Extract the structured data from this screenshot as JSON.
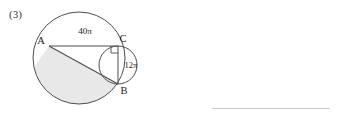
{
  "problem": {
    "number_label": "(3)"
  },
  "figure": {
    "name": "circle-geometry-figure",
    "points": [
      {
        "id": "A",
        "label": "A",
        "x": 49,
        "y": 46
      },
      {
        "id": "C",
        "label": "C",
        "x": 118,
        "y": 46
      },
      {
        "id": "B",
        "label": "B",
        "x": 118,
        "y": 84
      }
    ],
    "arc_labels": [
      {
        "id": "arc-AC",
        "label": "40π",
        "x": 85,
        "y": 31
      },
      {
        "id": "arc-CB",
        "label": "12π",
        "x": 131,
        "y": 65
      }
    ],
    "large_circle": {
      "cx": 79,
      "cy": 58,
      "r": 46
    },
    "small_circle": {
      "cx": 118,
      "cy": 65,
      "r": 19
    },
    "right_angle_at": "C",
    "shaded_region": "segment of large circle below chord AB",
    "colors": {
      "stroke": "#4d4d4d",
      "shade_fill": "#e8e8e8",
      "answer_line": "#c9c9cc",
      "text": "#1a1a1a"
    }
  },
  "answer_line": {
    "label": ""
  }
}
